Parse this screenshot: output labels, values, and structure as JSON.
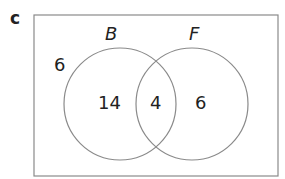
{
  "part_label": "c",
  "sets": [
    {
      "name": "B",
      "only": "14"
    },
    {
      "name": "F",
      "only": "6"
    }
  ],
  "intersection": "4",
  "outside": "6",
  "colors": {
    "stroke": "#8a8a8a",
    "text": "#222222"
  }
}
